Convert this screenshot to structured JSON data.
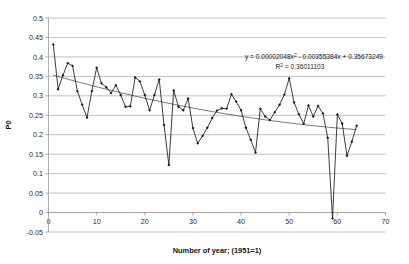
{
  "chart_data": {
    "type": "line",
    "title": "",
    "xlabel": "Number of year; (1951=1)",
    "ylabel": "P0",
    "xlim": [
      0,
      70
    ],
    "ylim": [
      -0.05,
      0.5
    ],
    "xticks": [
      0,
      10,
      20,
      30,
      40,
      50,
      60,
      70
    ],
    "yticks": [
      -0.05,
      0,
      0.05,
      0.1,
      0.15,
      0.2,
      0.25,
      0.3,
      0.35,
      0.4,
      0.45,
      0.5
    ],
    "xtick_labels": [
      "0",
      "10",
      "20",
      "30",
      "40",
      "50",
      "60",
      "70"
    ],
    "ytick_labels": [
      "-0.05",
      "0",
      "0.05",
      "0.1",
      "0.15",
      "0.2",
      "0.25",
      "0.3",
      "0.35",
      "0.4",
      "0.45",
      "0.5"
    ],
    "grid": true,
    "grid_axis": "y",
    "legend": false,
    "marker": "diamond",
    "series": [
      {
        "name": "P0",
        "x": [
          1,
          2,
          3,
          4,
          5,
          6,
          7,
          8,
          9,
          10,
          11,
          12,
          13,
          14,
          15,
          16,
          17,
          18,
          19,
          20,
          21,
          22,
          23,
          24,
          25,
          26,
          27,
          28,
          29,
          30,
          31,
          32,
          33,
          34,
          35,
          36,
          37,
          38,
          39,
          40,
          41,
          42,
          43,
          44,
          45,
          46,
          47,
          48,
          49,
          50,
          51,
          52,
          53,
          54,
          55,
          56,
          57,
          58,
          59,
          60,
          61,
          62,
          63,
          64
        ],
        "values": [
          0.432,
          0.317,
          0.353,
          0.384,
          0.377,
          0.312,
          0.277,
          0.244,
          0.312,
          0.372,
          0.332,
          0.322,
          0.307,
          0.327,
          0.302,
          0.272,
          0.273,
          0.347,
          0.337,
          0.302,
          0.263,
          0.302,
          0.342,
          0.225,
          0.122,
          0.314,
          0.272,
          0.263,
          0.293,
          0.217,
          0.178,
          0.197,
          0.218,
          0.243,
          0.262,
          0.268,
          0.267,
          0.304,
          0.285,
          0.263,
          0.218,
          0.187,
          0.154,
          0.267,
          0.247,
          0.238,
          0.258,
          0.277,
          0.303,
          0.345,
          0.283,
          0.253,
          0.228,
          0.275,
          0.247,
          0.274,
          0.255,
          0.192,
          -0.015,
          0.252,
          0.229,
          0.146,
          0.182,
          0.223
        ]
      }
    ],
    "trendline": {
      "type": "polynomial",
      "order": 2,
      "equation": "y = 0.00002048x2 - 0.00355384x + 0.35673249",
      "equation_prefix": "y = 0.00002048x",
      "equation_exponent": "2",
      "equation_suffix": " - 0.00355384x + 0.35673249",
      "r_squared_label": "R2 = 0.36011103",
      "r_squared_prefix": "R",
      "r_squared_exponent": "2",
      "r_squared_suffix": " = 0.36011103",
      "coefficients": [
        2.048e-05,
        -0.00355384,
        0.35673249
      ],
      "r_squared": 0.36011103
    },
    "colors": {
      "series": "#1a1a1a",
      "trendline": "#3d3d3d",
      "grid": "#a6a6a6",
      "axis": "#9a9a9a",
      "text": "#1a1a1a",
      "background": "#ffffff"
    }
  }
}
